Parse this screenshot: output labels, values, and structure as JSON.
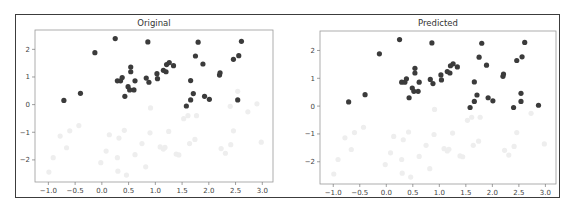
{
  "chart_data": [
    {
      "type": "scatter",
      "title": "Original",
      "xlabel": "",
      "ylabel": "",
      "xlim": [
        -1.25,
        3.2
      ],
      "ylim": [
        -2.8,
        2.7
      ],
      "xticks": [
        -1.0,
        -0.5,
        0.0,
        0.5,
        1.0,
        1.5,
        2.0,
        2.5,
        3.0
      ],
      "xtick_labels": [
        "−1.0",
        "−0.5",
        "0.0",
        "0.5",
        "1.0",
        "1.5",
        "2.0",
        "2.5",
        "3.0"
      ],
      "yticks": [
        2,
        1,
        0,
        -1,
        -2
      ],
      "ytick_labels": [
        "2",
        "1",
        "0",
        "−1",
        "−2"
      ],
      "grid": false,
      "series": [
        {
          "name": "class-1",
          "color": "#3b3b3b",
          "points": [
            [
              -0.71,
              0.15
            ],
            [
              -0.4,
              0.41
            ],
            [
              -0.13,
              1.88
            ],
            [
              0.25,
              2.39
            ],
            [
              0.29,
              0.86
            ],
            [
              0.35,
              0.86
            ],
            [
              0.38,
              0.98
            ],
            [
              0.43,
              0.3
            ],
            [
              0.49,
              0.65
            ],
            [
              0.52,
              0.53
            ],
            [
              0.54,
              1.36
            ],
            [
              0.54,
              1.19
            ],
            [
              0.6,
              0.53
            ],
            [
              0.62,
              0.86
            ],
            [
              0.83,
              0.96
            ],
            [
              0.88,
              0.81
            ],
            [
              0.86,
              2.27
            ],
            [
              1.03,
              1.12
            ],
            [
              1.04,
              0.94
            ],
            [
              1.15,
              1.24
            ],
            [
              1.2,
              1.19
            ],
            [
              1.21,
              1.45
            ],
            [
              1.26,
              1.52
            ],
            [
              1.34,
              1.41
            ],
            [
              1.58,
              -0.05
            ],
            [
              1.66,
              0.17
            ],
            [
              1.66,
              0.87
            ],
            [
              1.71,
              0.4
            ],
            [
              1.75,
              1.76
            ],
            [
              1.8,
              2.26
            ],
            [
              1.89,
              1.47
            ],
            [
              1.92,
              0.3
            ],
            [
              2.01,
              0.19
            ],
            [
              2.2,
              1.07
            ],
            [
              2.21,
              1.15
            ],
            [
              2.46,
              1.64
            ],
            [
              2.54,
              0.17
            ],
            [
              2.56,
              1.77
            ],
            [
              2.61,
              2.29
            ]
          ]
        },
        {
          "name": "class-0",
          "color": "#eeeeee",
          "points": [
            [
              -0.99,
              -2.44
            ],
            [
              -0.91,
              -1.92
            ],
            [
              -0.78,
              -1.14
            ],
            [
              -0.66,
              -1.56
            ],
            [
              -0.6,
              -0.95
            ],
            [
              -0.43,
              -0.76
            ],
            [
              -0.02,
              -2.1
            ],
            [
              0.08,
              -1.68
            ],
            [
              0.14,
              -1.09
            ],
            [
              0.29,
              -1.92
            ],
            [
              0.3,
              -2.41
            ],
            [
              0.32,
              -1.21
            ],
            [
              0.42,
              -0.93
            ],
            [
              0.46,
              -2.55
            ],
            [
              0.62,
              -1.81
            ],
            [
              0.75,
              -1.41
            ],
            [
              0.82,
              -2.25
            ],
            [
              0.9,
              -1.02
            ],
            [
              0.91,
              -0.12
            ],
            [
              1.09,
              -1.53
            ],
            [
              1.15,
              -1.61
            ],
            [
              1.18,
              -1.55
            ],
            [
              1.25,
              -0.97
            ],
            [
              1.39,
              -1.79
            ],
            [
              1.44,
              -1.82
            ],
            [
              1.53,
              -0.51
            ],
            [
              1.61,
              -0.4
            ],
            [
              1.64,
              -1.41
            ],
            [
              1.74,
              -1.26
            ],
            [
              1.77,
              -0.4
            ],
            [
              2.23,
              -1.59
            ],
            [
              2.31,
              -1.76
            ],
            [
              2.4,
              -0.06
            ],
            [
              2.41,
              -1.45
            ],
            [
              2.46,
              -0.95
            ],
            [
              2.54,
              0.48
            ],
            [
              2.73,
              -0.26
            ],
            [
              2.9,
              0.03
            ],
            [
              2.98,
              -1.36
            ]
          ]
        }
      ]
    },
    {
      "type": "scatter",
      "title": "Predicted",
      "xlabel": "",
      "ylabel": "",
      "xlim": [
        -1.25,
        3.2
      ],
      "ylim": [
        -2.8,
        2.7
      ],
      "xticks": [
        -1.0,
        -0.5,
        0.0,
        0.5,
        1.0,
        1.5,
        2.0,
        2.5,
        3.0
      ],
      "xtick_labels": [
        "−1.0",
        "−0.5",
        "0.0",
        "0.5",
        "1.0",
        "1.5",
        "2.0",
        "2.5",
        "3.0"
      ],
      "yticks": [
        2,
        1,
        0,
        -1,
        -2
      ],
      "ytick_labels": [
        "2",
        "1",
        "0",
        "−1",
        "−2"
      ],
      "grid": false,
      "series": [
        {
          "name": "class-1",
          "color": "#3b3b3b",
          "points": [
            [
              -0.71,
              0.15
            ],
            [
              -0.4,
              0.41
            ],
            [
              -0.13,
              1.88
            ],
            [
              0.25,
              2.39
            ],
            [
              0.29,
              0.86
            ],
            [
              0.35,
              0.86
            ],
            [
              0.38,
              0.98
            ],
            [
              0.43,
              0.3
            ],
            [
              0.49,
              0.65
            ],
            [
              0.52,
              0.53
            ],
            [
              0.54,
              1.36
            ],
            [
              0.54,
              1.19
            ],
            [
              0.6,
              0.53
            ],
            [
              0.62,
              0.86
            ],
            [
              0.83,
              0.96
            ],
            [
              0.88,
              0.81
            ],
            [
              0.86,
              2.27
            ],
            [
              1.03,
              1.12
            ],
            [
              1.04,
              0.94
            ],
            [
              1.15,
              1.24
            ],
            [
              1.2,
              1.19
            ],
            [
              1.21,
              1.45
            ],
            [
              1.26,
              1.52
            ],
            [
              1.34,
              1.41
            ],
            [
              1.58,
              -0.05
            ],
            [
              1.66,
              0.17
            ],
            [
              1.66,
              0.87
            ],
            [
              1.71,
              0.4
            ],
            [
              1.75,
              1.76
            ],
            [
              1.8,
              2.26
            ],
            [
              1.89,
              1.47
            ],
            [
              1.92,
              0.3
            ],
            [
              2.01,
              0.19
            ],
            [
              2.2,
              1.07
            ],
            [
              2.21,
              1.15
            ],
            [
              2.46,
              1.64
            ],
            [
              2.54,
              0.17
            ],
            [
              2.56,
              1.77
            ],
            [
              2.61,
              2.29
            ],
            [
              2.4,
              -0.05
            ],
            [
              2.54,
              0.46
            ],
            [
              2.87,
              0.03
            ]
          ]
        },
        {
          "name": "class-0",
          "color": "#eeeeee",
          "points": [
            [
              -0.99,
              -2.44
            ],
            [
              -0.91,
              -1.92
            ],
            [
              -0.78,
              -1.14
            ],
            [
              -0.66,
              -1.56
            ],
            [
              -0.6,
              -0.95
            ],
            [
              -0.43,
              -0.76
            ],
            [
              -0.02,
              -2.1
            ],
            [
              0.08,
              -1.68
            ],
            [
              0.14,
              -1.09
            ],
            [
              0.29,
              -1.92
            ],
            [
              0.3,
              -2.41
            ],
            [
              0.32,
              -1.21
            ],
            [
              0.42,
              -0.93
            ],
            [
              0.46,
              -2.55
            ],
            [
              0.62,
              -1.81
            ],
            [
              0.75,
              -1.41
            ],
            [
              0.82,
              -2.25
            ],
            [
              0.9,
              -1.02
            ],
            [
              0.91,
              -0.12
            ],
            [
              1.09,
              -1.53
            ],
            [
              1.15,
              -1.61
            ],
            [
              1.18,
              -1.55
            ],
            [
              1.25,
              -0.97
            ],
            [
              1.39,
              -1.79
            ],
            [
              1.44,
              -1.82
            ],
            [
              1.53,
              -0.51
            ],
            [
              1.61,
              -0.4
            ],
            [
              1.64,
              -1.41
            ],
            [
              1.74,
              -1.26
            ],
            [
              1.77,
              -0.4
            ],
            [
              2.23,
              -1.59
            ],
            [
              2.31,
              -1.76
            ],
            [
              2.41,
              -1.45
            ],
            [
              2.46,
              -0.95
            ],
            [
              2.73,
              -0.26
            ],
            [
              2.98,
              -1.36
            ]
          ]
        }
      ]
    }
  ]
}
